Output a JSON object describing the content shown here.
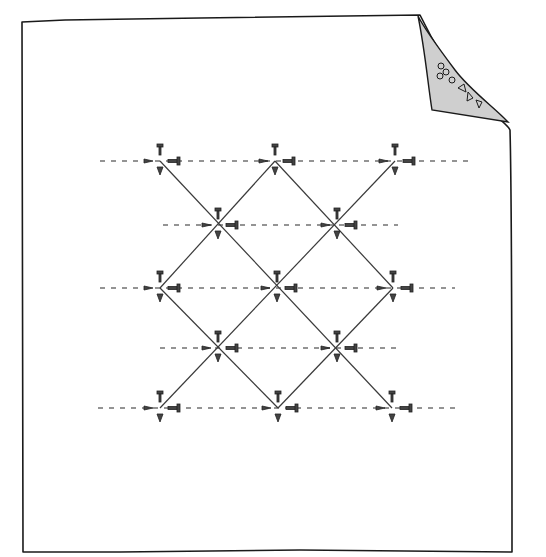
{
  "illustration": {
    "subject": "sheet of paper with curled top-right corner showing a diamond lattice of threads held by pins",
    "page": {
      "left": 22,
      "top": 20,
      "right": 512,
      "bottom": 552
    },
    "curl": {
      "fill": "#cfcfcf",
      "points": [
        [
          421,
          16
        ],
        [
          480,
          10
        ],
        [
          505,
          88
        ],
        [
          516,
          127
        ],
        [
          478,
          118
        ],
        [
          430,
          110
        ]
      ]
    },
    "colors": {
      "ink": "#1a1a1a",
      "paper": "#ffffff",
      "curl": "#cfcfcf"
    },
    "rows": [
      {
        "y": 161,
        "nodes": [
          160,
          275,
          395
        ],
        "dash_from": 100,
        "dash_to": 470
      },
      {
        "y": 225,
        "nodes": [
          218,
          337
        ],
        "dash_from": 163,
        "dash_to": 398
      },
      {
        "y": 288,
        "nodes": [
          160,
          277,
          393
        ],
        "dash_from": 100,
        "dash_to": 455
      },
      {
        "y": 348,
        "nodes": [
          218,
          337
        ],
        "dash_from": 160,
        "dash_to": 400
      },
      {
        "y": 408,
        "nodes": [
          160,
          278,
          392
        ],
        "dash_from": 98,
        "dash_to": 455
      }
    ],
    "lattice_lines": [
      [
        [
          160,
          161
        ],
        [
          392,
          408
        ]
      ],
      [
        [
          275,
          161
        ],
        [
          160,
          288
        ]
      ],
      [
        [
          275,
          161
        ],
        [
          393,
          288
        ]
      ],
      [
        [
          395,
          161
        ],
        [
          160,
          408
        ]
      ],
      [
        [
          160,
          288
        ],
        [
          278,
          408
        ]
      ],
      [
        [
          393,
          288
        ],
        [
          278,
          408
        ]
      ],
      [
        [
          160,
          161
        ],
        [
          160,
          161
        ]
      ]
    ]
  }
}
